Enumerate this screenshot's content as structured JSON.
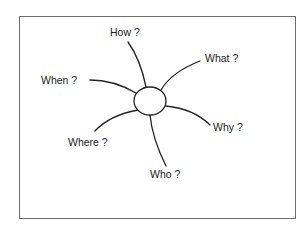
{
  "diagram": {
    "type": "spider-diagram",
    "center": {
      "label": "",
      "cx": 150,
      "cy": 101,
      "rx": 16,
      "ry": 14
    },
    "branches": [
      {
        "id": "how",
        "label": "How ?",
        "x": 110,
        "y": 27
      },
      {
        "id": "what",
        "label": "What ?",
        "x": 205,
        "y": 53
      },
      {
        "id": "when",
        "label": "When ?",
        "x": 41,
        "y": 75
      },
      {
        "id": "why",
        "label": "Why ?",
        "x": 213,
        "y": 122
      },
      {
        "id": "where",
        "label": "Where ?",
        "x": 68,
        "y": 137
      },
      {
        "id": "who",
        "label": "Who ?",
        "x": 150,
        "y": 169
      }
    ],
    "colors": {
      "line": "#222222",
      "frame": "#6e6e6e",
      "text": "#222222"
    }
  }
}
